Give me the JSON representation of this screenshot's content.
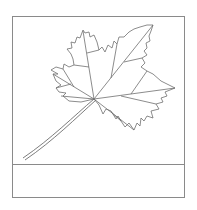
{
  "card": {
    "illustration": "maple-leaf-line-drawing",
    "label_text": ""
  },
  "colors": {
    "border": "#8a8a8a",
    "line": "#6e6e6e",
    "background": "#ffffff"
  }
}
